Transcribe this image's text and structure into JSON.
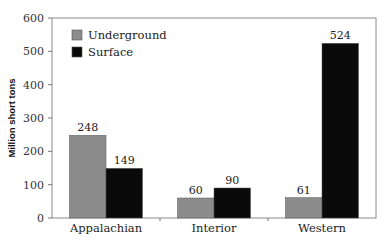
{
  "chart_data": {
    "type": "bar",
    "title": "",
    "xlabel": "",
    "ylabel": "Million short tons",
    "ylim": [
      0,
      600
    ],
    "yticks": [
      0,
      100,
      200,
      300,
      400,
      500,
      600
    ],
    "grid": false,
    "legend_position": "upper-left-inside",
    "categories": [
      "Appalachian",
      "Interior",
      "Western"
    ],
    "series": [
      {
        "name": "Underground",
        "color": "#8c8c8c",
        "values": [
          248,
          60,
          61
        ]
      },
      {
        "name": "Surface",
        "color": "#0a0a0a",
        "values": [
          149,
          90,
          524
        ]
      }
    ]
  }
}
